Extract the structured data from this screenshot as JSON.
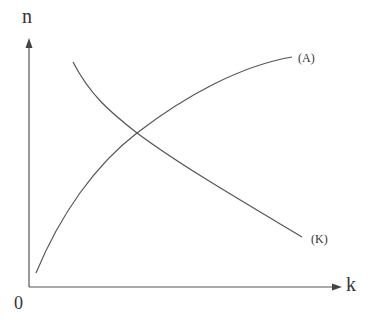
{
  "diagram": {
    "axes": {
      "y_label": "n",
      "x_label": "k",
      "origin_label": "0"
    },
    "curves": [
      {
        "id": "A",
        "label": "(A)",
        "shape": "concave-increasing"
      },
      {
        "id": "K",
        "label": "(K)",
        "shape": "convex-decreasing"
      }
    ],
    "colors": {
      "line": "#555555",
      "text": "#333333"
    }
  }
}
